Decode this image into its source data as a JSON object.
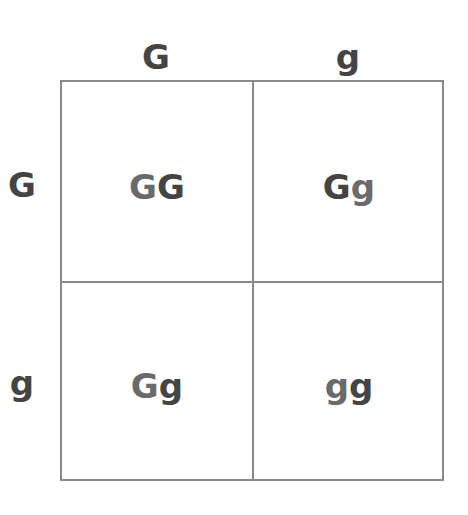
{
  "punnett_square": {
    "column_alleles": [
      "G",
      "g"
    ],
    "row_alleles": [
      "G",
      "g"
    ],
    "cells": [
      {
        "row": 0,
        "col": 0,
        "first": "G",
        "second": "G"
      },
      {
        "row": 0,
        "col": 1,
        "first": "G",
        "second": "g"
      },
      {
        "row": 1,
        "col": 0,
        "first": "G",
        "second": "g"
      },
      {
        "row": 1,
        "col": 1,
        "first": "g",
        "second": "g"
      }
    ],
    "colors": {
      "border": "#8a8a8a",
      "text_dark": "#444444",
      "text_light": "#6a6a6a"
    }
  }
}
